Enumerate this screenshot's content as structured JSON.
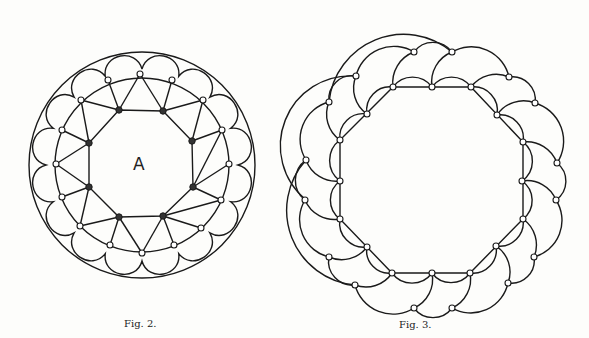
{
  "figures": [
    {
      "caption": "Fig. 2.",
      "center_label": "A"
    },
    {
      "caption": "Fig. 3."
    }
  ],
  "colors": {
    "ink": "#1a1a1a",
    "paper": "#fdfdfb"
  }
}
